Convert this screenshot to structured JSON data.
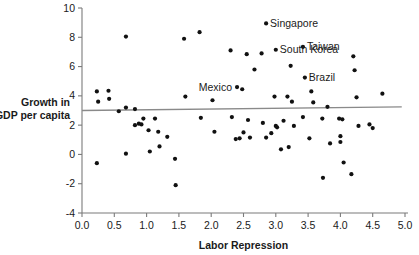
{
  "chart_data": {
    "type": "scatter",
    "title": "",
    "xlabel": "Labor Repression",
    "ylabel": "Growth in GDP per capita",
    "ylabel_line1": "Growth in",
    "ylabel_line2": "GDP per capita",
    "xlim": [
      0.0,
      5.0
    ],
    "ylim": [
      -4,
      10
    ],
    "xticks": [
      "0.0",
      "0.5",
      "1.0",
      "1.5",
      "2.0",
      "2.5",
      "3.0",
      "3.5",
      "4.0",
      "4.5",
      "5.0"
    ],
    "xtick_values": [
      0.0,
      0.5,
      1.0,
      1.5,
      2.0,
      2.5,
      3.0,
      3.5,
      4.0,
      4.5,
      5.0
    ],
    "yticks": [
      "10",
      "8",
      "6",
      "4",
      "2",
      "0",
      "-2",
      "-4"
    ],
    "ytick_values": [
      10,
      8,
      6,
      4,
      2,
      0,
      -2,
      -4
    ],
    "grid": false,
    "legend": false,
    "marker_color": "#111111",
    "axis_color": "#7b7b7b",
    "trend_line": {
      "name": "regression-line",
      "color": "#8a8a8a",
      "x_start": 0.0,
      "y_start": 3.0,
      "x_end": 4.95,
      "y_end": 3.25
    },
    "annotations": [
      {
        "label": "Singapore",
        "x": 2.85,
        "y": 8.95,
        "label_side": "right"
      },
      {
        "label": "Taiwan",
        "x": 3.42,
        "y": 7.35,
        "label_side": "right"
      },
      {
        "label": "South Korea",
        "x": 3.0,
        "y": 7.15,
        "label_side": "right"
      },
      {
        "label": "Brazil",
        "x": 3.45,
        "y": 5.25,
        "label_side": "right"
      },
      {
        "label": "Mexico",
        "x": 2.4,
        "y": 4.6,
        "label_side": "left"
      }
    ],
    "points": [
      {
        "x": 0.23,
        "y": 4.3
      },
      {
        "x": 0.25,
        "y": 3.6
      },
      {
        "x": 0.23,
        "y": -0.6
      },
      {
        "x": 0.41,
        "y": 4.35
      },
      {
        "x": 0.42,
        "y": 3.8
      },
      {
        "x": 0.57,
        "y": 2.95
      },
      {
        "x": 0.68,
        "y": 8.05
      },
      {
        "x": 0.68,
        "y": 3.2
      },
      {
        "x": 0.68,
        "y": 0.05
      },
      {
        "x": 0.82,
        "y": 3.1
      },
      {
        "x": 0.82,
        "y": 2.0
      },
      {
        "x": 0.88,
        "y": 2.1
      },
      {
        "x": 0.92,
        "y": 2.05
      },
      {
        "x": 0.95,
        "y": 2.45
      },
      {
        "x": 1.03,
        "y": 1.65
      },
      {
        "x": 1.05,
        "y": 0.2
      },
      {
        "x": 1.13,
        "y": 2.45
      },
      {
        "x": 1.18,
        "y": 1.55
      },
      {
        "x": 1.2,
        "y": 0.55
      },
      {
        "x": 1.32,
        "y": 1.2
      },
      {
        "x": 1.44,
        "y": -0.3
      },
      {
        "x": 1.45,
        "y": -2.1
      },
      {
        "x": 1.58,
        "y": 7.9
      },
      {
        "x": 1.6,
        "y": 3.95
      },
      {
        "x": 1.82,
        "y": 8.35
      },
      {
        "x": 1.84,
        "y": 2.5
      },
      {
        "x": 2.02,
        "y": 3.7
      },
      {
        "x": 2.05,
        "y": 1.55
      },
      {
        "x": 2.3,
        "y": 7.1
      },
      {
        "x": 2.32,
        "y": 2.55
      },
      {
        "x": 2.38,
        "y": 1.05
      },
      {
        "x": 2.44,
        "y": 1.1
      },
      {
        "x": 2.48,
        "y": 4.45
      },
      {
        "x": 2.5,
        "y": 1.5
      },
      {
        "x": 2.55,
        "y": 6.85
      },
      {
        "x": 2.57,
        "y": 2.35
      },
      {
        "x": 2.6,
        "y": 1.15
      },
      {
        "x": 2.67,
        "y": 5.8
      },
      {
        "x": 2.78,
        "y": 6.9
      },
      {
        "x": 2.8,
        "y": 2.15
      },
      {
        "x": 2.85,
        "y": 1.15
      },
      {
        "x": 2.93,
        "y": 1.45
      },
      {
        "x": 2.98,
        "y": 3.95
      },
      {
        "x": 3.0,
        "y": 1.95
      },
      {
        "x": 3.02,
        "y": 1.85
      },
      {
        "x": 3.08,
        "y": 0.35
      },
      {
        "x": 3.12,
        "y": 2.3
      },
      {
        "x": 3.18,
        "y": 3.95
      },
      {
        "x": 3.2,
        "y": 0.5
      },
      {
        "x": 3.23,
        "y": 6.05
      },
      {
        "x": 3.25,
        "y": 3.6
      },
      {
        "x": 3.28,
        "y": 1.95
      },
      {
        "x": 3.42,
        "y": 2.55
      },
      {
        "x": 3.52,
        "y": 1.1
      },
      {
        "x": 3.55,
        "y": 4.3
      },
      {
        "x": 3.58,
        "y": 3.55
      },
      {
        "x": 3.72,
        "y": 2.45
      },
      {
        "x": 3.73,
        "y": -1.6
      },
      {
        "x": 3.8,
        "y": 3.25
      },
      {
        "x": 3.84,
        "y": 0.75
      },
      {
        "x": 3.98,
        "y": 2.45
      },
      {
        "x": 4.0,
        "y": 1.25
      },
      {
        "x": 4.0,
        "y": 0.85
      },
      {
        "x": 4.03,
        "y": 2.4
      },
      {
        "x": 4.05,
        "y": -0.55
      },
      {
        "x": 4.17,
        "y": -1.35
      },
      {
        "x": 4.2,
        "y": 6.7
      },
      {
        "x": 4.22,
        "y": 5.75
      },
      {
        "x": 4.25,
        "y": 3.9
      },
      {
        "x": 4.28,
        "y": 1.95
      },
      {
        "x": 4.45,
        "y": 2.05
      },
      {
        "x": 4.5,
        "y": 1.8
      },
      {
        "x": 4.65,
        "y": 4.15
      }
    ]
  }
}
